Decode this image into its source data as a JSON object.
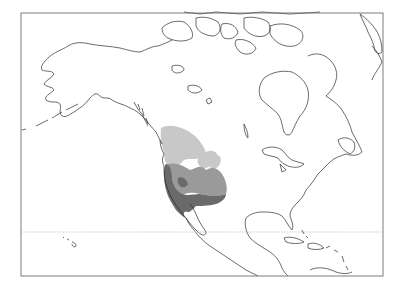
{
  "map": {
    "type": "range-map",
    "region": "North America",
    "frame": {
      "x": 21,
      "y": 13,
      "width": 362,
      "height": 263,
      "stroke": "#6e6e6e"
    },
    "reference_lines": [
      {
        "name": "tropic-of-cancer",
        "y": 232,
        "style": "dotted",
        "color": "#b0b0b0"
      }
    ],
    "range_zones": [
      {
        "name": "northern-zone",
        "fill": "#c8c8c8",
        "label": "light gray"
      },
      {
        "name": "central-zone",
        "fill": "#9a9a9a",
        "label": "medium gray"
      },
      {
        "name": "southern-zone",
        "fill": "#6a6a6a",
        "label": "dark gray"
      }
    ],
    "coastline_color": "#2b2b2b",
    "background": "#ffffff"
  }
}
